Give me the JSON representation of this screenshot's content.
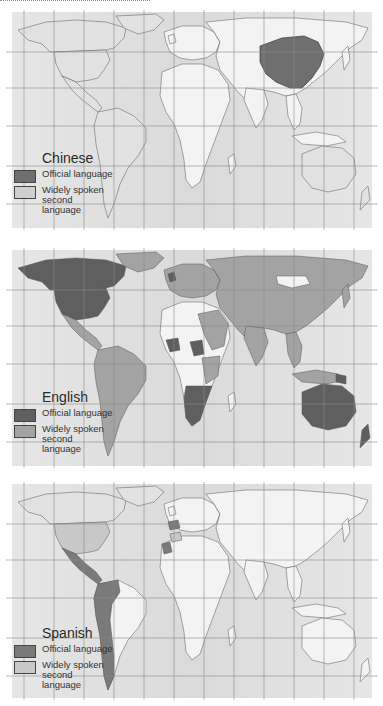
{
  "colors": {
    "ocean": "#e6e6e6",
    "ocean_center": "#dadada",
    "land_none": "#f3f3f3",
    "official": "#6f6f6f",
    "second": "#a3a3a3",
    "second_light": "#cfcfcf",
    "border": "#555555",
    "grid": "#8c8c8c"
  },
  "maps": [
    {
      "title": "Chinese",
      "legend": [
        {
          "label": "Official language",
          "swatch": "#6f6f6f"
        },
        {
          "label": "Widely spoken second language",
          "swatch": "#cfcfcf"
        }
      ],
      "official_regions": [
        "China"
      ],
      "second_language_regions": []
    },
    {
      "title": "English",
      "legend": [
        {
          "label": "Official language",
          "swatch": "#5f5f5f"
        },
        {
          "label": "Widely spoken second language",
          "swatch": "#a3a3a3"
        }
      ],
      "official_regions": [
        "USA",
        "Canada",
        "Greenland (north)",
        "UK",
        "Ireland",
        "Nigeria",
        "Ghana",
        "Sierra Leone",
        "Liberia",
        "Guyana",
        "Belize",
        "Jamaica",
        "Zimbabwe",
        "Zambia",
        "Botswana",
        "Namibia",
        "South Africa",
        "Uganda",
        "Kenya",
        "Australia",
        "New Zealand",
        "Papua New Guinea"
      ],
      "second_language_regions": [
        "Europe",
        "Russia",
        "Asia",
        "South America",
        "Central America",
        "Mexico",
        "Middle East",
        "India",
        "East Africa",
        "Southeast Asia"
      ]
    },
    {
      "title": "Spanish",
      "legend": [
        {
          "label": "Official language",
          "swatch": "#7a7a7a"
        },
        {
          "label": "Widely spoken second language",
          "swatch": "#c8c8c8"
        }
      ],
      "official_regions": [
        "Spain",
        "Mexico",
        "Central America",
        "Cuba",
        "Colombia",
        "Venezuela",
        "Ecuador",
        "Peru",
        "Bolivia",
        "Chile",
        "Argentina",
        "Paraguay",
        "Uruguay",
        "Western Sahara"
      ],
      "second_language_regions": [
        "USA",
        "Morocco"
      ]
    }
  ]
}
